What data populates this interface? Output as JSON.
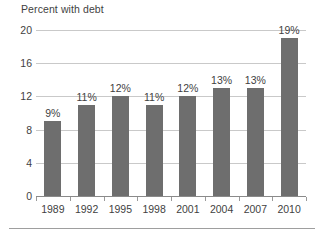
{
  "chart_data": {
    "type": "bar",
    "title": "Percent with debt",
    "xlabel": "",
    "ylabel": "",
    "categories": [
      "1989",
      "1992",
      "1995",
      "1998",
      "2001",
      "2004",
      "2007",
      "2010"
    ],
    "values": [
      9,
      11,
      12,
      11,
      12,
      13,
      13,
      19
    ],
    "value_labels": [
      "9%",
      "11%",
      "12%",
      "11%",
      "12%",
      "13%",
      "13%",
      "19%"
    ],
    "ylim": [
      0,
      20
    ],
    "yticks": [
      0,
      4,
      8,
      12,
      16,
      20
    ],
    "ytick_labels": [
      "0",
      "4",
      "8",
      "12",
      "16",
      "20"
    ],
    "grid": "horizontal",
    "legend": "none",
    "series": [
      {
        "name": "Percent with debt",
        "values": [
          9,
          11,
          12,
          11,
          12,
          13,
          13,
          19
        ]
      }
    ],
    "colors": {
      "bar": "#6e6e6e",
      "gridline": "#c9c9c9",
      "axis": "#8a8a8a",
      "text": "#3f3f3f",
      "background": "#ffffff"
    }
  }
}
